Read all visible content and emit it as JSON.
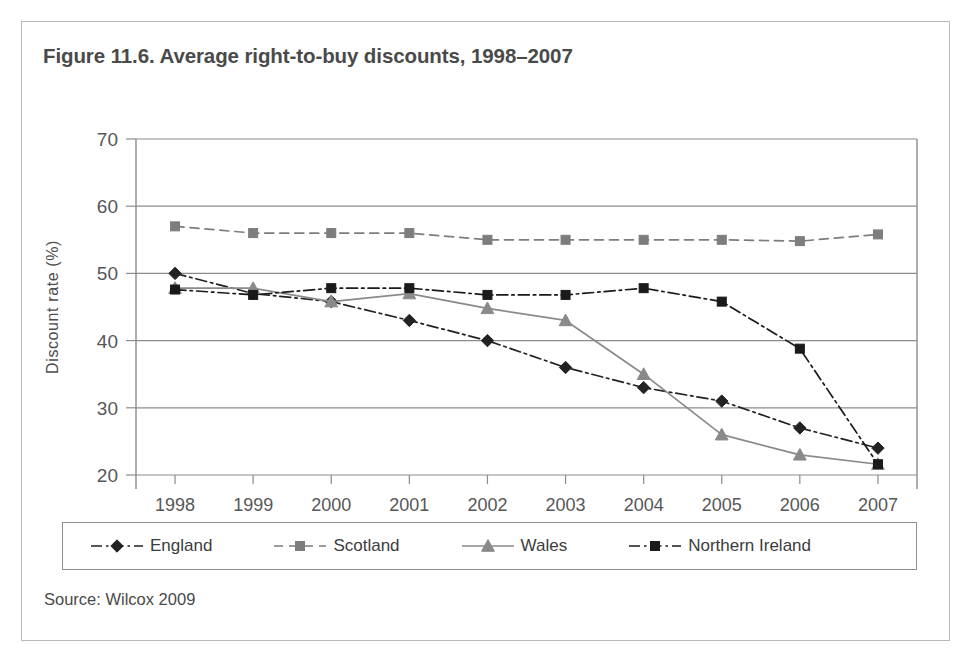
{
  "figure": {
    "title": "Figure 11.6. Average right-to-buy discounts, 1998–2007",
    "source": "Source: Wilcox 2009"
  },
  "chart_data": {
    "type": "line",
    "title": "Figure 11.6. Average right-to-buy discounts, 1998–2007",
    "xlabel": "",
    "ylabel": "Discount rate (%)",
    "categories": [
      "1998",
      "1999",
      "2000",
      "2001",
      "2002",
      "2003",
      "2004",
      "2005",
      "2006",
      "2007"
    ],
    "x": [
      1998,
      1999,
      2000,
      2001,
      2002,
      2003,
      2004,
      2005,
      2006,
      2007
    ],
    "ylim": [
      20,
      70
    ],
    "yticks": [
      20,
      30,
      40,
      50,
      60,
      70
    ],
    "ytick_labels": [
      "20",
      "30",
      "40",
      "50",
      "60",
      "70"
    ],
    "grid": true,
    "legend_position": "bottom",
    "series": [
      {
        "name": "England",
        "values": [
          50,
          47,
          45.8,
          43,
          40,
          36,
          33,
          31,
          27,
          24
        ],
        "color": "#222222",
        "marker": "diamond",
        "dash": "dashdot"
      },
      {
        "name": "Scotland",
        "values": [
          57,
          56,
          56,
          56,
          55,
          55,
          55,
          55,
          54.8,
          55.8
        ],
        "color": "#7d7d7d",
        "marker": "square",
        "dash": "dashed"
      },
      {
        "name": "Wales",
        "values": [
          47.8,
          47.8,
          45.8,
          47,
          44.8,
          43,
          35,
          26,
          23,
          21.6
        ],
        "color": "#8a8a8a",
        "marker": "triangle",
        "dash": "solid"
      },
      {
        "name": "Northern Ireland",
        "values": [
          47.6,
          46.8,
          47.8,
          47.8,
          46.8,
          46.8,
          47.8,
          45.8,
          38.8,
          21.6
        ],
        "color": "#1a1a1a",
        "marker": "square",
        "dash": "dashdot"
      }
    ]
  },
  "legend": {
    "items": [
      {
        "label": "England"
      },
      {
        "label": "Scotland"
      },
      {
        "label": "Wales"
      },
      {
        "label": "Northern Ireland"
      }
    ]
  }
}
